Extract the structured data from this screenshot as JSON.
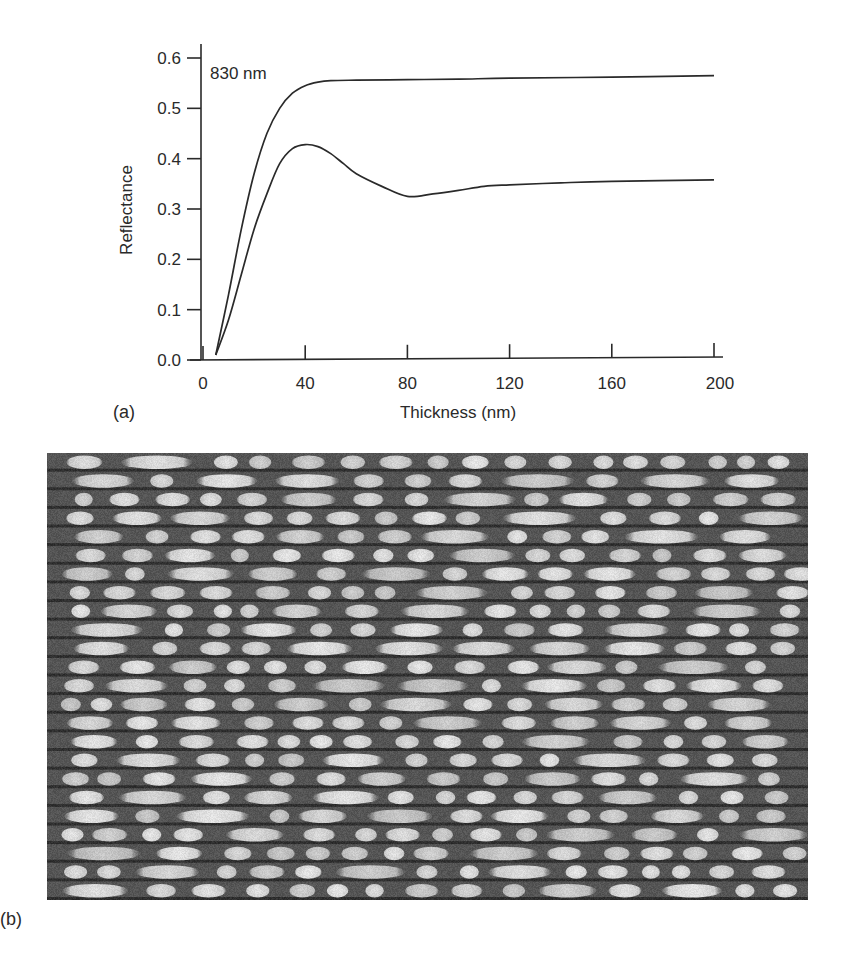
{
  "figure": {
    "panel_a_label": "(a)",
    "panel_b_label": "(b)",
    "annotation": "830 nm"
  },
  "chart_data": {
    "type": "line",
    "title": "",
    "annotation": "830 nm",
    "xlabel": "Thickness (nm)",
    "ylabel": "Reflectance",
    "xlim": [
      0,
      200
    ],
    "ylim": [
      0,
      0.6
    ],
    "xticks": [
      "0",
      "40",
      "80",
      "120",
      "160",
      "200"
    ],
    "yticks": [
      "0.0",
      "0.1",
      "0.2",
      "0.3",
      "0.4",
      "0.5",
      "0.6"
    ],
    "grid": false,
    "legend": null,
    "series": [
      {
        "name": "upper curve",
        "x": [
          5,
          10,
          15,
          20,
          25,
          30,
          35,
          40,
          45,
          50,
          60,
          80,
          100,
          120,
          160,
          200
        ],
        "y": [
          0.01,
          0.13,
          0.26,
          0.37,
          0.45,
          0.5,
          0.53,
          0.545,
          0.552,
          0.555,
          0.556,
          0.557,
          0.558,
          0.56,
          0.562,
          0.565
        ]
      },
      {
        "name": "lower curve",
        "x": [
          5,
          10,
          15,
          20,
          25,
          30,
          35,
          40,
          45,
          50,
          55,
          60,
          70,
          80,
          90,
          100,
          110,
          120,
          140,
          160,
          200
        ],
        "y": [
          0.01,
          0.08,
          0.17,
          0.26,
          0.33,
          0.39,
          0.42,
          0.428,
          0.424,
          0.41,
          0.39,
          0.37,
          0.345,
          0.325,
          0.33,
          0.337,
          0.345,
          0.348,
          0.352,
          0.355,
          0.358
        ]
      }
    ]
  },
  "image_b": {
    "description": "grayscale micrograph of bright elongated marks arranged in horizontal tracks",
    "track_count": 24
  }
}
